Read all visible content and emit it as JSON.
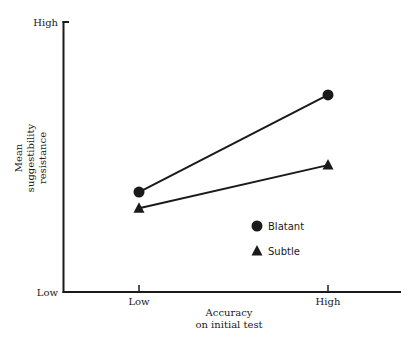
{
  "chart_data": {
    "type": "line",
    "title": "",
    "xlabel": "Accuracy on initial test",
    "xlabel_lines": [
      "Accuracy",
      "on initial test"
    ],
    "ylabel": "Mean suggestibility resistance",
    "ylabel_lines": [
      "Mean",
      "suggestibility",
      "resistance"
    ],
    "categories": [
      "Low",
      "High"
    ],
    "y_tick_labels": {
      "top": "High",
      "bottom": "Low"
    },
    "ylim": [
      0,
      100
    ],
    "grid": false,
    "legend_position": "inside-lower-right",
    "series": [
      {
        "name": "Blatant",
        "marker": "circle",
        "values": [
          37,
          73
        ]
      },
      {
        "name": "Subtle",
        "marker": "triangle",
        "values": [
          31,
          47
        ]
      }
    ]
  },
  "legend": {
    "items": [
      {
        "label": "Blatant",
        "icon": "filled-circle-icon"
      },
      {
        "label": "Subtle",
        "icon": "filled-triangle-icon"
      }
    ]
  },
  "colors": {
    "ink": "#1a1a1a",
    "background": "#ffffff"
  }
}
